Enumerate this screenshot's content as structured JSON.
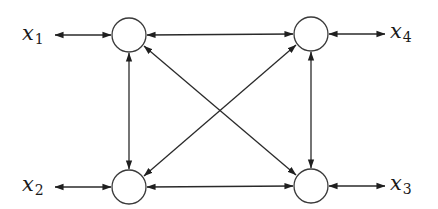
{
  "diagram": {
    "type": "network",
    "nodes": [
      {
        "id": "n1",
        "cx": 129,
        "cy": 35,
        "r": 17
      },
      {
        "id": "n4",
        "cx": 311,
        "cy": 34,
        "r": 17
      },
      {
        "id": "n2",
        "cx": 129,
        "cy": 187,
        "r": 17
      },
      {
        "id": "n3",
        "cx": 311,
        "cy": 186,
        "r": 17
      }
    ],
    "labels": [
      {
        "id": "x1",
        "base": "x",
        "sub": "1",
        "node": "n1",
        "side": "left"
      },
      {
        "id": "x4",
        "base": "x",
        "sub": "4",
        "node": "n4",
        "side": "right"
      },
      {
        "id": "x2",
        "base": "x",
        "sub": "2",
        "node": "n2",
        "side": "left"
      },
      {
        "id": "x3",
        "base": "x",
        "sub": "3",
        "node": "n3",
        "side": "right"
      }
    ],
    "edges": [
      {
        "from": "n1",
        "to": "n4",
        "direction": "bidirectional"
      },
      {
        "from": "n2",
        "to": "n3",
        "direction": "bidirectional"
      },
      {
        "from": "n1",
        "to": "n2",
        "direction": "bidirectional"
      },
      {
        "from": "n4",
        "to": "n3",
        "direction": "bidirectional"
      },
      {
        "from": "n1",
        "to": "n3",
        "direction": "bidirectional"
      },
      {
        "from": "n4",
        "to": "n2",
        "direction": "bidirectional"
      },
      {
        "from": "x1",
        "to": "n1",
        "direction": "bidirectional"
      },
      {
        "from": "x4",
        "to": "n4",
        "direction": "bidirectional"
      },
      {
        "from": "x2",
        "to": "n2",
        "direction": "bidirectional"
      },
      {
        "from": "x3",
        "to": "n3",
        "direction": "bidirectional"
      }
    ]
  },
  "text": {
    "x1_base": "x",
    "x1_sub": "1",
    "x2_base": "x",
    "x2_sub": "2",
    "x3_base": "x",
    "x3_sub": "3",
    "x4_base": "x",
    "x4_sub": "4"
  },
  "colors": {
    "line": "#2a2a2a",
    "node_stroke": "#3a3a3a",
    "background": "#ffffff"
  }
}
